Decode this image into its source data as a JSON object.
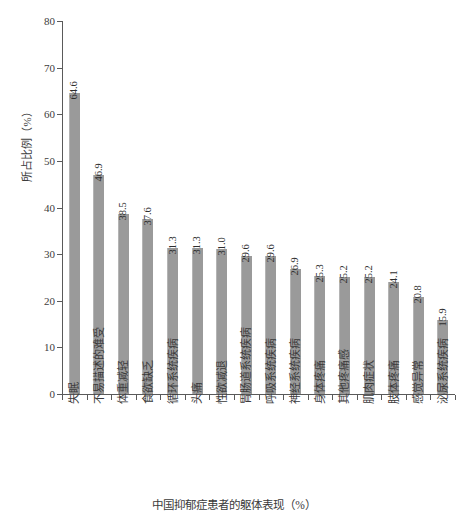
{
  "chart_data": {
    "type": "bar",
    "title": "",
    "subtitle": "",
    "xlabel": "中国抑郁症患者的躯体表现（%）",
    "ylabel": "所占比例（%）",
    "ylim": [
      0,
      80
    ],
    "ytick_step": 10,
    "ytick_labels": [
      "0",
      "10",
      "20",
      "30",
      "40",
      "50",
      "60",
      "70",
      "80"
    ],
    "grid": false,
    "legend": null,
    "bar_color": "#9a9a9a",
    "axis_color": "#5a5a5a",
    "value_label_format": "one-decimal",
    "orientation": "vertical",
    "label_rotation_deg": 90,
    "categories": [
      "失眠",
      "不易描述的难受",
      "体重减轻",
      "食欲缺乏",
      "循环系统疾病",
      "头痛",
      "性欲减退",
      "胃肠道系统疾病",
      "呼吸系统疾病",
      "神经系统疾病",
      "身体疼痛",
      "其他疼痛感",
      "肌肉症状",
      "肢体疼痛",
      "感觉异常",
      "泌尿系统疾病"
    ],
    "values": [
      64.6,
      46.9,
      38.5,
      37.6,
      31.3,
      31.3,
      31.0,
      29.6,
      29.6,
      26.9,
      25.3,
      25.2,
      25.2,
      24.1,
      20.8,
      15.9
    ],
    "value_labels": [
      "64.6",
      "46.9",
      "38.5",
      "37.6",
      "31.3",
      "31.3",
      "31.0",
      "29.6",
      "29.6",
      "26.9",
      "25.3",
      "25.2",
      "25.2",
      "24.1",
      "20.8",
      "15.9"
    ]
  }
}
